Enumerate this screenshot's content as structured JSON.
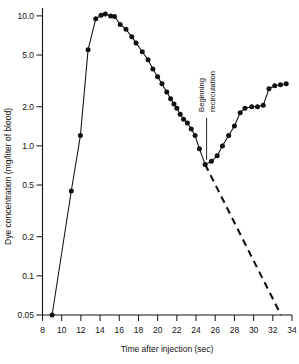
{
  "chart_data": {
    "type": "line",
    "title": "",
    "xlabel": "Time after injection (sec)",
    "ylabel": "Dye concentration (mg/liter of blood)",
    "yscale": "log",
    "xlim": [
      8,
      34
    ],
    "ylim": [
      0.05,
      11.5
    ],
    "grid": false,
    "legend": null,
    "xticks": [
      8,
      10,
      12,
      14,
      16,
      18,
      20,
      22,
      24,
      26,
      28,
      30,
      32,
      34
    ],
    "xtick_labels": [
      "8",
      "10",
      "12",
      "14",
      "16",
      "18",
      "20",
      "22",
      "24",
      "26",
      "28",
      "30",
      "32",
      "34"
    ],
    "yticks": [
      0.05,
      0.1,
      0.2,
      0.5,
      1.0,
      2.0,
      5.0,
      10.0
    ],
    "ytick_labels": [
      "0.05",
      "0.1",
      "0.2",
      "0.5",
      "1.0",
      "2.0",
      "5.0",
      "10.0"
    ],
    "series": [
      {
        "name": "measured dye concentration",
        "style": "solid-with-markers",
        "x": [
          9.0,
          11.0,
          11.95,
          12.75,
          13.55,
          14.1,
          14.55,
          15.1,
          15.5,
          16.1,
          16.7,
          17.3,
          17.75,
          18.4,
          19.0,
          19.5,
          20.0,
          20.45,
          20.95,
          21.35,
          21.7,
          22.0,
          22.35,
          22.7,
          23.1,
          23.5,
          23.9,
          24.35,
          24.95,
          25.6,
          26.2,
          26.75,
          27.4,
          28.0,
          28.6,
          29.1,
          29.8,
          30.4,
          31.0,
          31.6,
          32.2,
          32.8,
          33.4
        ],
        "y": [
          0.05,
          0.45,
          1.2,
          5.5,
          9.5,
          10.1,
          10.35,
          10.0,
          9.9,
          8.6,
          7.9,
          6.9,
          6.2,
          5.3,
          4.6,
          3.9,
          3.4,
          3.0,
          2.6,
          2.3,
          2.1,
          1.95,
          1.75,
          1.6,
          1.5,
          1.35,
          1.2,
          0.95,
          0.72,
          0.76,
          0.84,
          1.0,
          1.2,
          1.42,
          1.8,
          1.95,
          2.0,
          2.0,
          2.05,
          2.75,
          2.9,
          2.95,
          3.0
        ]
      },
      {
        "name": "extrapolated exponential decay",
        "style": "dashed",
        "x": [
          24.95,
          32.85
        ],
        "y": [
          0.72,
          0.05
        ]
      }
    ],
    "annotations": [
      {
        "name": "beginning-recirculation",
        "lines": [
          "Beginning",
          "recirculation"
        ],
        "text": "Beginning recirculation",
        "rotation": -90,
        "points_to_x": 25.1,
        "points_to_y": 0.78
      }
    ]
  },
  "axes": {
    "x_title": "Time after injection (sec)",
    "y_title": "Dye concentration (mg/liter of blood)"
  }
}
